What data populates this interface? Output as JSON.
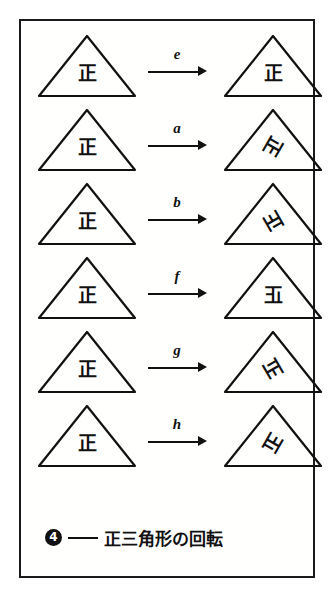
{
  "figure": {
    "caption": {
      "number": "4",
      "dash": "——",
      "text": "正三角形の回転"
    },
    "base_glyph": "正",
    "rows": [
      {
        "id": "row-e",
        "label": "e",
        "source_glyph": "正",
        "source_transform": "rot0",
        "result_glyph": "正",
        "result_transform": "rot0"
      },
      {
        "id": "row-a",
        "label": "a",
        "source_glyph": "正",
        "source_transform": "rot0",
        "result_glyph": "正",
        "result_transform": "rot120"
      },
      {
        "id": "row-b",
        "label": "b",
        "source_glyph": "正",
        "source_transform": "rot0",
        "result_glyph": "正",
        "result_transform": "rot240"
      },
      {
        "id": "row-f",
        "label": "f",
        "source_glyph": "正",
        "source_transform": "rot0",
        "result_glyph": "正",
        "result_transform": "mir0"
      },
      {
        "id": "row-g",
        "label": "g",
        "source_glyph": "正",
        "source_transform": "rot0",
        "result_glyph": "正",
        "result_transform": "mir120"
      },
      {
        "id": "row-h",
        "label": "h",
        "source_glyph": "正",
        "source_transform": "rot0",
        "result_glyph": "正",
        "result_transform": "mir240"
      }
    ],
    "colors": {
      "ink": "#111111",
      "paper": "#ffffff"
    }
  }
}
